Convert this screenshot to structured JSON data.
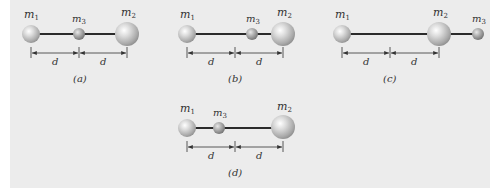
{
  "figure": {
    "background": "#ececec",
    "rod_color": "#2b2b2b",
    "sphere_color": "#b8b8b8",
    "panels": [
      {
        "id": "a",
        "caption": "(a)",
        "distance_label_left": "d",
        "distance_label_right": "d",
        "masses": [
          {
            "name": "m",
            "sub": "1",
            "position": "left"
          },
          {
            "name": "m",
            "sub": "3",
            "position": "middle"
          },
          {
            "name": "m",
            "sub": "2",
            "position": "right"
          }
        ]
      },
      {
        "id": "b",
        "caption": "(b)",
        "distance_label_left": "d",
        "distance_label_right": "d",
        "masses": [
          {
            "name": "m",
            "sub": "1",
            "position": "left"
          },
          {
            "name": "m",
            "sub": "3",
            "position": "between middle and m2"
          },
          {
            "name": "m",
            "sub": "2",
            "position": "right"
          }
        ]
      },
      {
        "id": "c",
        "caption": "(c)",
        "distance_label_left": "d",
        "distance_label_right": "d",
        "masses": [
          {
            "name": "m",
            "sub": "1",
            "position": "left"
          },
          {
            "name": "m",
            "sub": "2",
            "position": "right of center"
          },
          {
            "name": "m",
            "sub": "3",
            "position": "outside, right of m2"
          }
        ]
      },
      {
        "id": "d",
        "caption": "(d)",
        "distance_label_left": "d",
        "distance_label_right": "d",
        "masses": [
          {
            "name": "m",
            "sub": "1",
            "position": "left"
          },
          {
            "name": "m",
            "sub": "3",
            "position": "between m1 and middle"
          },
          {
            "name": "m",
            "sub": "2",
            "position": "right"
          }
        ]
      }
    ]
  }
}
